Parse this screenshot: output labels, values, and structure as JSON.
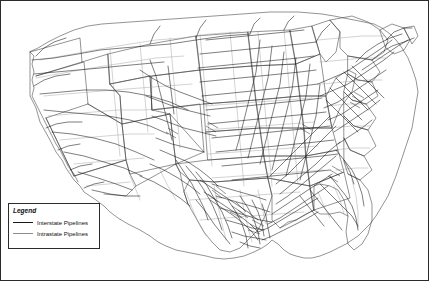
{
  "figure": {
    "type": "map",
    "background_color": "#ffffff",
    "border_color": "#2b2b2b"
  },
  "legend": {
    "title": "Legend",
    "items": [
      {
        "label": "Interstate Pipelines",
        "color": "#1a1a1a",
        "width_px": 1
      },
      {
        "label": "Intrastate Pipelines",
        "color": "#8c8c8c",
        "width_px": 1
      }
    ]
  },
  "map_layers": {
    "state_boundaries_color": "#3a3a3a",
    "interstate_pipeline_color": "#141414",
    "intrastate_pipeline_color": "#8f8f8f"
  }
}
